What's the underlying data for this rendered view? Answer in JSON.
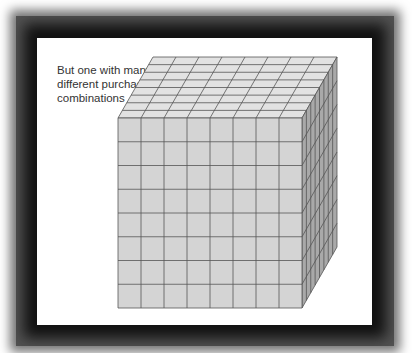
{
  "caption": {
    "text": "But one with many\ndifferent purchase\ncombinations"
  },
  "cube": {
    "grid_size": 8,
    "front": {
      "x": 118,
      "y": 118,
      "width": 184,
      "height": 190
    },
    "depth": {
      "dx": 35,
      "dy": -61
    },
    "colors": {
      "front_fill": "#d4d4d4",
      "top_fill": "#e2e2e2",
      "side_fill": "#a9a9a9",
      "line": "#555555"
    }
  },
  "frame": {
    "color": "#1a1a1a",
    "panel_color": "#ffffff"
  }
}
